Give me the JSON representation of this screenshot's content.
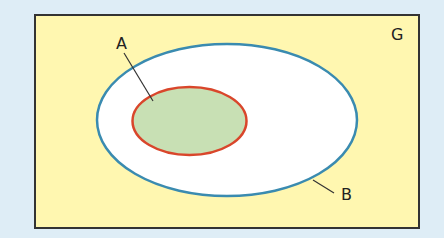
{
  "diagram": {
    "type": "venn-subset",
    "universe": {
      "label": "G",
      "fill": "#fff7b0",
      "stroke": "#333333"
    },
    "sets": [
      {
        "label": "B",
        "fill": "#ffffff",
        "stroke": "#3a8bb0",
        "contains": [
          "A"
        ]
      },
      {
        "label": "A",
        "fill": "#c8e0b4",
        "stroke": "#d9462b",
        "subset_of": "B"
      }
    ],
    "background": "#deedf6"
  }
}
